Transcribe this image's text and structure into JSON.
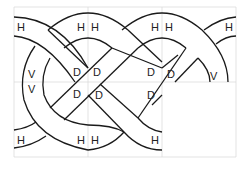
{
  "diagram": {
    "title": "",
    "grid": {
      "cols": 3,
      "rows": 2,
      "x": [
        14,
        88,
        162,
        236
      ],
      "y": [
        7,
        82,
        157
      ]
    },
    "labels": [
      {
        "t": "H",
        "x": 17,
        "y": 31
      },
      {
        "t": "H",
        "x": 77,
        "y": 31
      },
      {
        "t": "H",
        "x": 91,
        "y": 31
      },
      {
        "t": "H",
        "x": 151,
        "y": 31
      },
      {
        "t": "H",
        "x": 165,
        "y": 31
      },
      {
        "t": "H",
        "x": 225,
        "y": 31
      },
      {
        "t": "V",
        "x": 28,
        "y": 78
      },
      {
        "t": "V",
        "x": 28,
        "y": 93
      },
      {
        "t": "D",
        "x": 73,
        "y": 76
      },
      {
        "t": "D",
        "x": 93,
        "y": 76
      },
      {
        "t": "D",
        "x": 73,
        "y": 98
      },
      {
        "t": "D",
        "x": 95,
        "y": 99
      },
      {
        "t": "D",
        "x": 147,
        "y": 76
      },
      {
        "t": "D",
        "x": 167,
        "y": 78
      },
      {
        "t": "D",
        "x": 147,
        "y": 99
      },
      {
        "t": "V",
        "x": 210,
        "y": 80
      },
      {
        "t": "H",
        "x": 17,
        "y": 144
      },
      {
        "t": "H",
        "x": 77,
        "y": 144
      },
      {
        "t": "H",
        "x": 91,
        "y": 144
      },
      {
        "t": "H",
        "x": 151,
        "y": 144
      }
    ]
  }
}
